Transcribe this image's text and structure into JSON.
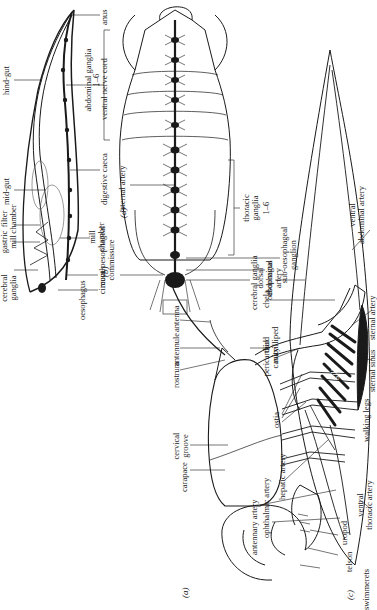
{
  "figure": {
    "orientation": "rotated 90 degrees counter-clockwise",
    "panels": [
      {
        "id": "a",
        "tag": "(a)",
        "subject": "external anatomy, lateral view",
        "labels": {
          "carapace": "carapace",
          "cervical_groove": "cervical groove",
          "rostrum": "rostrum",
          "antennule": "antennule",
          "antenna": "antenna",
          "third_maxilliped": "third maxilliped",
          "chela": "chela",
          "walking_legs": "walking legs",
          "uropod": "uropod",
          "telson": "telson",
          "swimmerets": "swimmerets"
        }
      },
      {
        "id": "b",
        "tag": "(b)",
        "subject": "alimentary canal and nerve cord, sagittal view",
        "labels": {
          "cerebral_ganglia": "cerebral ganglia",
          "gastric_mill": "gastric mill",
          "filter_chamber": "filter chamber",
          "mid_gut": "mid-gut",
          "hind_gut": "hind-gut",
          "anus": "anus",
          "ventral_nerve_cord": "ventral nerve cord",
          "digestive_caeca": "digestive caeca",
          "mill_chamber": "mill chamber",
          "mouth": "mouth",
          "oesophagus": "oesophagus"
        }
      },
      {
        "id": "c",
        "tag": "(c)",
        "subject": "circulatory system, lateral view",
        "labels": {
          "ophthalmic_artery": "ophthalmic artery",
          "antennary_artery": "antennary artery",
          "hepatic_artery": "hepatic artery",
          "ostia": "ostia",
          "pericardial_cavity": "pericardial cavity",
          "dorsal_abdominal_artery": "dorsal abdominal artery",
          "ventral_abdominal_artery": "ventral abdominal artery",
          "sternal_artery": "sternal artery",
          "gills": "gills",
          "sternal_sinus": "sternal sinus",
          "ventral_thoracic_artery": "ventral thoracic artery"
        }
      },
      {
        "id": "d",
        "tag": "(d)",
        "subject": "nervous system, ventral view",
        "labels": {
          "cerebral_ganglia": "cerebral ganglia",
          "oesophagus": "oesophagus",
          "sub_oesophageal_ganglion": "sub-oesophageal ganglion",
          "thoracic_ganglia": "thoracic ganglia",
          "thoracic_range": "1–6",
          "circum_oesophageal_commissure": "circum-oesophageal commissure",
          "sternal_artery": "sternal artery",
          "abdominal_ganglia": "abdominal ganglia",
          "abdominal_range": "1–6"
        }
      }
    ]
  }
}
